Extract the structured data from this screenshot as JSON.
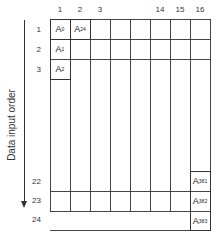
{
  "diagram": {
    "axis_label": "Data input order",
    "column_labels": [
      "1",
      "2",
      "3",
      "",
      "",
      "14",
      "15",
      "16"
    ],
    "row_labels": {
      "top": [
        "1",
        "2",
        "3"
      ],
      "bottom": [
        "22",
        "23",
        "24"
      ]
    },
    "cells": [
      {
        "row": "1",
        "col": "1",
        "base": "A",
        "sub": "0"
      },
      {
        "row": "1",
        "col": "2",
        "base": "A",
        "sub": "24"
      },
      {
        "row": "2",
        "col": "1",
        "base": "A",
        "sub": "1"
      },
      {
        "row": "3",
        "col": "1",
        "base": "A",
        "sub": "2"
      },
      {
        "row": "22",
        "col": "16",
        "base": "A",
        "sub": "381"
      },
      {
        "row": "23",
        "col": "16",
        "base": "A",
        "sub": "382"
      },
      {
        "row": "24",
        "col": "16",
        "base": "A",
        "sub": "383"
      }
    ],
    "colors": {
      "line": "#444444",
      "text": "#333333",
      "background": "#ffffff"
    }
  }
}
